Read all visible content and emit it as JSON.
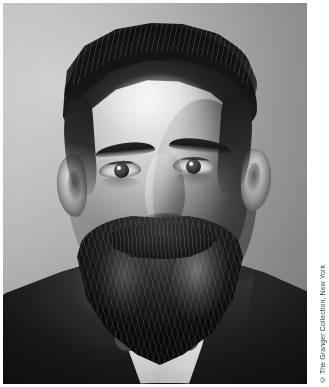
{
  "figure": {
    "kind": "photograph",
    "medium": "black-and-white portrait photograph",
    "subject_description": "Bust-length studio portrait of a bearded middle-aged man facing the camera, wearing a dark suit jacket over a white wing collar, against a plain light-grey studio backdrop.",
    "orientation": "portrait",
    "credit": "© The Granger Collection, New York",
    "colors": {
      "backdrop_light": "#c7c7c7",
      "backdrop_mid": "#a2a2a2",
      "backdrop_dark": "#8b8b8b",
      "skin_highlight": "#e9e5dd",
      "skin_mid": "#c6c0b4",
      "skin_shadow": "#8b8477",
      "hair_dark": "#171513",
      "beard_dark": "#1a1512",
      "collar_white": "#f3f1ec",
      "suit_black": "#1b1b1b",
      "page_background": "#ffffff",
      "credit_text": "#3b3b3b"
    }
  }
}
